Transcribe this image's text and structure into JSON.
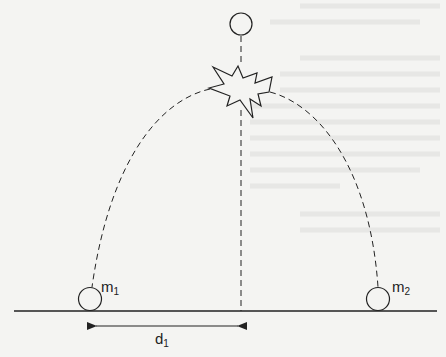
{
  "diagram": {
    "type": "projectile-explosion",
    "labels": {
      "mass1": "m",
      "mass1_sub": "1",
      "mass2": "m",
      "mass2_sub": "2",
      "distance": "d",
      "distance_sub": "1"
    },
    "colors": {
      "background": "#f4f4f2",
      "stroke": "#222222",
      "ghost_text": "#dcdcda"
    },
    "elements": {
      "top_ball": {
        "cx": 241,
        "cy": 24,
        "r": 11
      },
      "explosion": {
        "cx": 240,
        "cy": 90
      },
      "ground": {
        "y": 311,
        "x1": 14,
        "x2": 437
      },
      "mass1_ball": {
        "cx": 90,
        "cy": 299,
        "r": 12
      },
      "mass2_ball": {
        "cx": 378,
        "cy": 299,
        "r": 12
      },
      "d1_arrow": {
        "y": 326,
        "x1": 96,
        "x2": 238
      }
    }
  }
}
